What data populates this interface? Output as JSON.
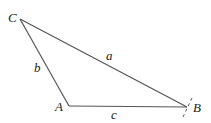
{
  "diagram": {
    "type": "triangle",
    "line_color": "#555555",
    "label_color": "#222222",
    "vertices": {
      "A": {
        "label": "A",
        "x": 69,
        "y": 106
      },
      "B": {
        "label": "B",
        "x": 187,
        "y": 107
      },
      "C": {
        "label": "C",
        "x": 20,
        "y": 19
      }
    },
    "sides": {
      "a": {
        "label": "a",
        "from": "B",
        "to": "C"
      },
      "b": {
        "label": "b",
        "from": "A",
        "to": "C"
      },
      "c": {
        "label": "c",
        "from": "A",
        "to": "B"
      }
    }
  }
}
